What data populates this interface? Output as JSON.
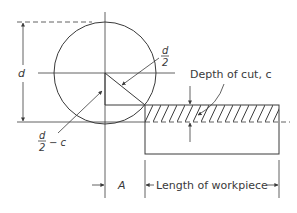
{
  "diagram": {
    "labels": {
      "diameter": "d",
      "half_diameter_num": "d",
      "half_diameter_den": "2",
      "half_minus_c_num": "d",
      "half_minus_c_den": "2",
      "half_minus_c_suffix": "− c",
      "depth_of_cut": "Depth of cut, c",
      "approach": "A",
      "length": "Length of workpiece"
    },
    "colors": {
      "stroke": "#3a3a3a",
      "background": "#ffffff"
    },
    "geometry": {
      "cutter_center": [
        105,
        73
      ],
      "cutter_radius": 51,
      "workpiece_rect": [
        145,
        105,
        134,
        49
      ],
      "depth_band_height": 17
    }
  }
}
